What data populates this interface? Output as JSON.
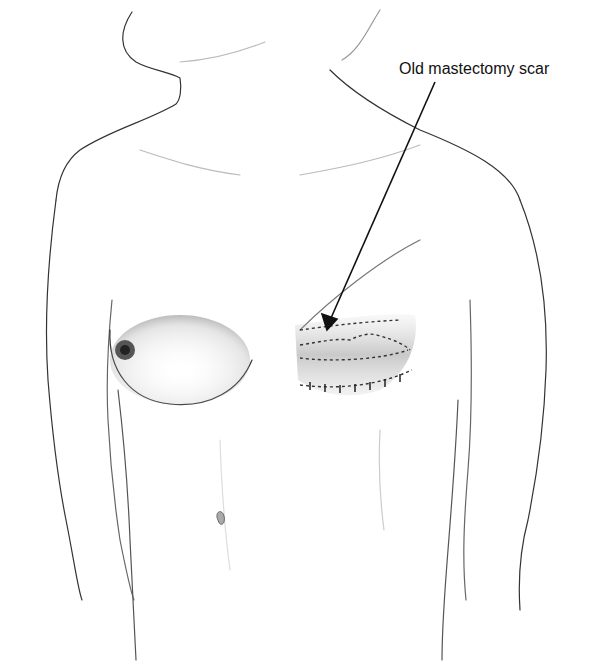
{
  "figure": {
    "annotation": {
      "label": "Old mastectomy scar",
      "pointer": "arrow"
    }
  }
}
